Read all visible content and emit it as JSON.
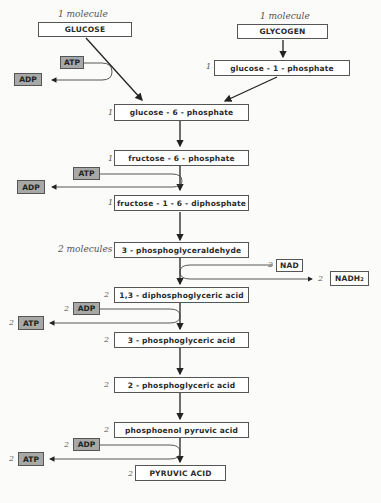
{
  "diagram": {
    "title": "",
    "type": "metabolic-pathway",
    "starting_points": [
      {
        "label": "1 molecule",
        "name": "GLUCOSE"
      },
      {
        "label": "1 molecule",
        "name": "GLYCOGEN"
      }
    ],
    "steps": [
      {
        "count": "1",
        "name": "glucose - 1 - phosphate"
      },
      {
        "count": "1",
        "name": "glucose - 6 - phosphate"
      },
      {
        "count": "1",
        "name": "fructose - 6 - phosphate"
      },
      {
        "count": "1",
        "name": "fructose - 1 - 6 - diphosphate"
      },
      {
        "count": "2 molecules",
        "name": "3 - phosphoglyceraldehyde"
      },
      {
        "count": "2",
        "name": "1,3 - diphosphoglyceric  acid"
      },
      {
        "count": "2",
        "name": "3 - phosphoglyceric  acid"
      },
      {
        "count": "2",
        "name": "2 - phosphoglyceric  acid"
      },
      {
        "count": "2",
        "name": "phosphoenol  pyruvic  acid"
      },
      {
        "count": "2",
        "name": "PYRUVIC  ACID"
      }
    ],
    "cofactors": [
      {
        "id": "atp1",
        "count": "",
        "label": "ATP"
      },
      {
        "id": "adp1",
        "count": "",
        "label": "ADP"
      },
      {
        "id": "atp2",
        "count": "",
        "label": "ATP"
      },
      {
        "id": "adp2",
        "count": "",
        "label": "ADP"
      },
      {
        "id": "nad",
        "count": "2",
        "label": "NAD"
      },
      {
        "id": "nadh2",
        "count": "2",
        "label": "NADH",
        "sub": "2"
      },
      {
        "id": "adp3",
        "count": "2",
        "label": "ADP"
      },
      {
        "id": "atp3",
        "count": "2",
        "label": "ATP"
      },
      {
        "id": "adp4",
        "count": "2",
        "label": "ADP"
      },
      {
        "id": "atp4",
        "count": "2",
        "label": "ATP"
      }
    ],
    "colors": {
      "box_fill": "#ffffff",
      "cofactor_fill": "#a8a8a8",
      "line": "#222222",
      "background": "#fbfbf9"
    }
  }
}
